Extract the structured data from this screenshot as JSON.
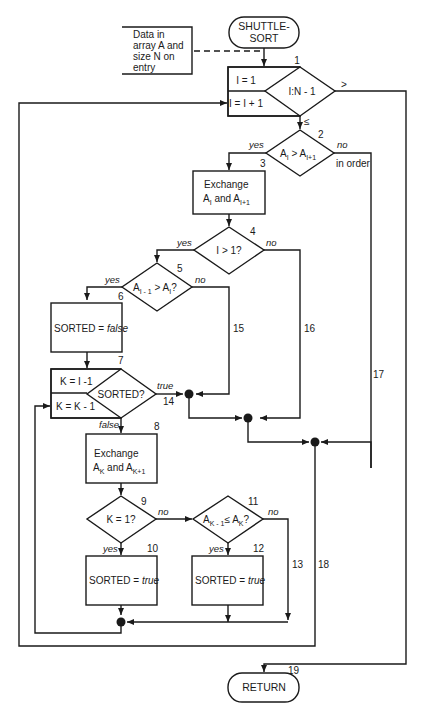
{
  "diagram": {
    "start": {
      "line1": "SHUTTLE-",
      "line2": "SORT"
    },
    "entry_note": {
      "lines": [
        "Data in",
        "array A and",
        "size N on",
        "entry"
      ]
    },
    "end": {
      "label": "RETURN"
    },
    "nodes": {
      "n1": {
        "number": "1",
        "init": "I = 1",
        "incr": "I = I + 1",
        "test": "I:N - 1",
        "gt_label": ">",
        "le_label": "≤"
      },
      "n2": {
        "number": "2",
        "test_a": "A",
        "test_sub1": "I",
        "test_op": " > A",
        "test_sub2": "I+1",
        "yes": "yes",
        "no": "no",
        "no_note": "in order"
      },
      "n3": {
        "number": "3",
        "line1": "Exchange",
        "line2_a": "A",
        "line2_sub1": "I",
        "line2_mid": " and A",
        "line2_sub2": "I+1"
      },
      "n4": {
        "number": "4",
        "test": "I > 1?",
        "yes": "yes",
        "no": "no"
      },
      "n5": {
        "number": "5",
        "test_a": "A",
        "test_sub1": "I - 1",
        "test_op": " > A",
        "test_sub2": "I",
        "test_end": "?",
        "yes": "yes",
        "no": "no"
      },
      "n6": {
        "number": "6",
        "text": "SORTED = ",
        "value": "false"
      },
      "n7": {
        "number": "7",
        "init": "K = I -1",
        "incr": "K = K - 1",
        "test": "SORTED?",
        "true": "true",
        "false": "false"
      },
      "n8": {
        "number": "8",
        "line1": "Exchange",
        "line2_a": "A",
        "line2_sub1": "K",
        "line2_mid": " and A",
        "line2_sub2": "K+1"
      },
      "n9": {
        "number": "9",
        "test": "K = 1?",
        "yes": "yes",
        "no": "no"
      },
      "n10": {
        "number": "10",
        "text": "SORTED = ",
        "value": "true"
      },
      "n11": {
        "number": "11",
        "test_a": "A",
        "test_sub1": "K - 1",
        "test_op": "≤ A",
        "test_sub2": "K",
        "test_end": "?",
        "yes": "yes",
        "no": "no"
      },
      "n12": {
        "number": "12",
        "text": "SORTED = ",
        "value": "true"
      }
    },
    "connector_labels": {
      "c13": "13",
      "c14": "14",
      "c15": "15",
      "c16": "16",
      "c17": "17",
      "c18": "18",
      "c19": "19"
    }
  }
}
